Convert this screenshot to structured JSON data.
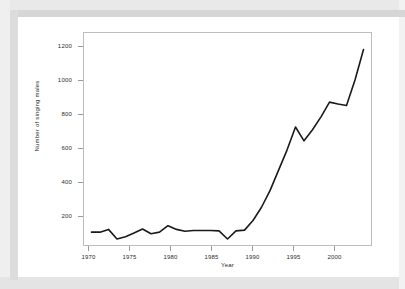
{
  "chart_data": {
    "type": "line",
    "title": "",
    "xlabel": "Year",
    "ylabel": "Number of singing males",
    "xlim": [
      1970,
      2004
    ],
    "ylim": [
      130,
      1290
    ],
    "grid": false,
    "legend": "none",
    "line_color": "#1a1a1a",
    "xticks": [
      1970,
      1975,
      1980,
      1985,
      1990,
      1995,
      2000
    ],
    "yticks": [
      200,
      400,
      600,
      800,
      1000,
      1200
    ],
    "x": [
      1971,
      1972,
      1973,
      1974,
      1975,
      1976,
      1977,
      1978,
      1979,
      1980,
      1981,
      1982,
      1983,
      1984,
      1985,
      1986,
      1987,
      1988,
      1989,
      1990,
      1991,
      1992,
      1993,
      1994,
      1995,
      1996,
      1997,
      1998,
      1999,
      2000,
      2001,
      2002,
      2003
    ],
    "values": [
      205,
      205,
      220,
      168,
      180,
      200,
      222,
      196,
      205,
      240,
      220,
      210,
      214,
      214,
      214,
      212,
      168,
      212,
      216,
      268,
      340,
      430,
      540,
      650,
      775,
      700,
      760,
      830,
      910,
      900,
      892,
      1030,
      1195
    ]
  },
  "axes": {
    "ytick_labels": [
      "1200",
      "1000",
      "800",
      "600",
      "400",
      "200"
    ],
    "xtick_labels": [
      "1970",
      "1975",
      "1980",
      "1985",
      "1990",
      "1995",
      "2000"
    ]
  }
}
